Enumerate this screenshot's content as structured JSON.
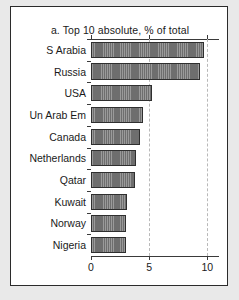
{
  "figure": {
    "title": "a. Top 10 absolute, % of total",
    "panel_background": "#ffffff",
    "page_background": "#e9e9e9",
    "border_color": "#2b2b2b"
  },
  "chart_data": {
    "type": "bar",
    "orientation": "horizontal",
    "title": "a. Top 10 absolute, % of total",
    "xlabel": "",
    "ylabel": "",
    "categories": [
      "S Arabia",
      "Russia",
      "USA",
      "Un Arab Em",
      "Canada",
      "Netherlands",
      "Qatar",
      "Kuwait",
      "Norway",
      "Nigeria"
    ],
    "values": [
      9.7,
      9.4,
      5.2,
      4.5,
      4.2,
      3.85,
      3.8,
      3.1,
      3.05,
      3.0
    ],
    "xlim": [
      0,
      11.0
    ],
    "xticks": [
      0,
      5,
      10
    ],
    "xtick_labels": [
      "0",
      "5",
      "10"
    ],
    "gridlines_at": [
      5,
      10
    ],
    "grid": "dashed-vertical",
    "legend": "none",
    "bar_fill_color": "#6e6e6e",
    "bar_edge_color": "#2f2f2f",
    "gridline_color": "#b9b9b9",
    "axis_color": "#3a3a3a"
  }
}
